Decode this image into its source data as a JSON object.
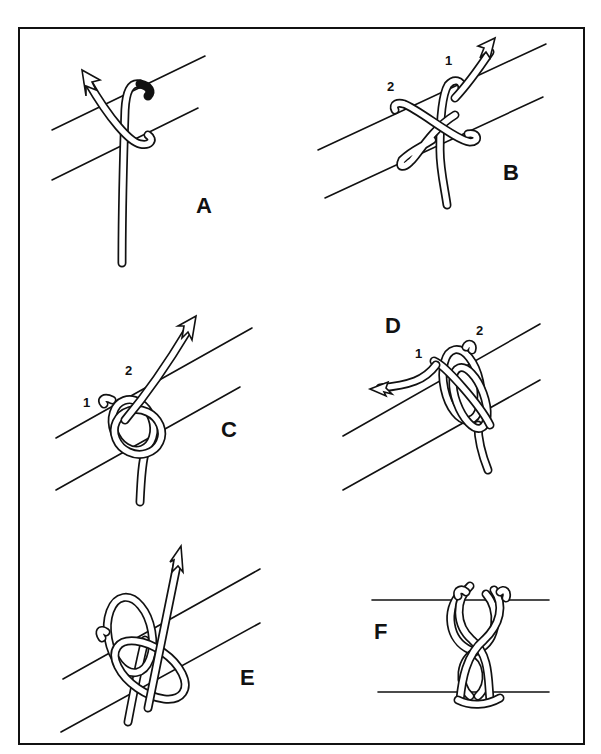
{
  "figure": {
    "panels": [
      {
        "id": "A",
        "label": "A",
        "strand_labels": []
      },
      {
        "id": "B",
        "label": "B",
        "strand_labels": [
          "1",
          "2"
        ]
      },
      {
        "id": "C",
        "label": "C",
        "strand_labels": [
          "1",
          "2"
        ]
      },
      {
        "id": "D",
        "label": "D",
        "strand_labels": [
          "1",
          "2"
        ]
      },
      {
        "id": "E",
        "label": "E",
        "strand_labels": []
      },
      {
        "id": "F",
        "label": "F",
        "strand_labels": []
      }
    ],
    "colors": {
      "ink": "#111111",
      "paper": "#ffffff"
    }
  }
}
